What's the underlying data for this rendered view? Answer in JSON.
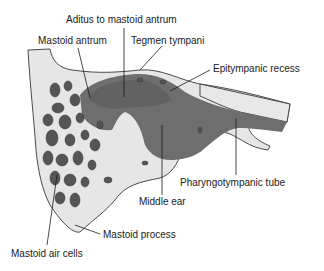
{
  "diagram": {
    "type": "anatomical cross-section",
    "colors": {
      "bone": "#e6e6e6",
      "bone_outline": "#4a4a4a",
      "cavity": "#6e6e6e",
      "cavity_dark": "#4f4f4f",
      "air_cell": "#555555",
      "leader_line": "#1a1a1a",
      "text": "#1a1a1a"
    },
    "labels": [
      {
        "id": "aditus",
        "text": "Aditus to mastoid antrum"
      },
      {
        "id": "mastoid_antrum",
        "text": "Mastoid antrum"
      },
      {
        "id": "tegmen_tympani",
        "text": "Tegmen tympani"
      },
      {
        "id": "epitympanic_recess",
        "text": "Epitympanic recess"
      },
      {
        "id": "pharyngotympanic_tube",
        "text": "Pharyngotympanic tube"
      },
      {
        "id": "middle_ear",
        "text": "Middle ear"
      },
      {
        "id": "mastoid_process",
        "text": "Mastoid process"
      },
      {
        "id": "mastoid_air_cells",
        "text": "Mastoid air cells"
      }
    ]
  }
}
